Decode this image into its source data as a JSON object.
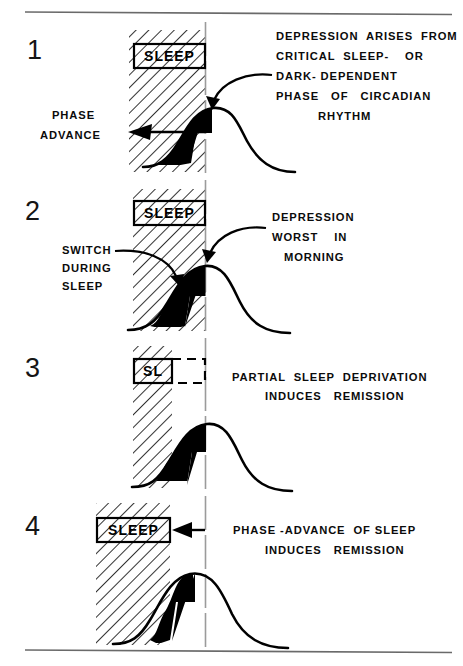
{
  "figure": {
    "title_caption": "",
    "type": "scientific-schematic",
    "colors": {
      "ink": "#000000",
      "paper": "#ffffff",
      "hatch": "#000000",
      "rule": "#555555"
    },
    "panels": [
      {
        "number": "1",
        "sleep_box_label": "SLEEP",
        "left_label_lines": [
          "PHASE",
          "ADVANCE"
        ],
        "annotation_lines": [
          "DEPRESSION  ARISES  FROM",
          "CRITICAL  SLEEP-    OR",
          "DARK- DEPENDENT",
          "PHASE   OF   CIRCADIAN",
          "RHYTHM"
        ]
      },
      {
        "number": "2",
        "sleep_box_label": "SLEEP",
        "left_label_lines": [
          "SWITCH",
          "DURING",
          "SLEEP"
        ],
        "annotation_lines": [
          "DEPRESSION",
          "WORST    IN",
          "MORNING"
        ]
      },
      {
        "number": "3",
        "sleep_box_label": "SL",
        "left_label_lines": [],
        "annotation_lines": [
          "PARTIAL  SLEEP  DEPRIVATION",
          "INDUCES   REMISSION"
        ]
      },
      {
        "number": "4",
        "sleep_box_label": "SLEEP",
        "left_label_lines": [],
        "annotation_lines": [
          "PHASE -ADVANCE  OF SLEEP",
          "INDUCES   REMISSION"
        ]
      }
    ]
  }
}
